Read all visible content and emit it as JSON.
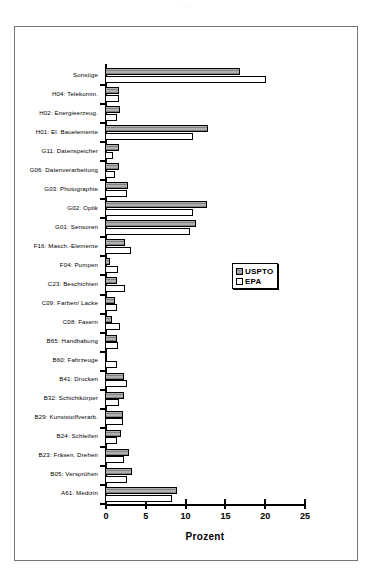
{
  "page": {
    "artifact_text": "..."
  },
  "chart_data": {
    "type": "bar",
    "orientation": "horizontal",
    "title": "",
    "xlabel": "Prozent",
    "ylabel": "",
    "xlim": [
      0,
      25
    ],
    "xticks": [
      0,
      5,
      10,
      15,
      20,
      25
    ],
    "grid": false,
    "legend_position": "center-right",
    "categories": [
      "Sonstige",
      "H04: Telekomm.",
      "H02:  Energieerzeug.",
      "H01: El. Bauelemente",
      "G11: Datenspeicher",
      "G06: Datenverarbeitung",
      "G03: Photographie",
      "G02: Optik",
      "G01: Sensoren",
      "F16: Masch.-Elemente",
      "F04: Pumpen",
      "C23: Beschichten",
      "C09: Farben/ Lacke",
      "C08: Fasern",
      "B65: Handhabung",
      "B60: Fahrzeuge",
      "B41: Drucken",
      "B32: Schichtkörper",
      "B29: Kunststoffverarb.",
      "B24: Schleifen",
      "B23: Fräsen, Drehen",
      "B05: Versprühen",
      "A61: Medizin"
    ],
    "series": [
      {
        "name": "USPTO",
        "color": "#b0b0b0",
        "pattern": "horizontal-hatch",
        "values": [
          17.0,
          1.7,
          1.9,
          13.0,
          1.8,
          1.8,
          2.9,
          12.8,
          11.4,
          2.5,
          0.6,
          1.5,
          1.3,
          0.9,
          1.5,
          0.2,
          2.4,
          2.4,
          2.2,
          2.0,
          3.0,
          3.4,
          9.1
        ]
      },
      {
        "name": "EPA",
        "color": "#ffffff",
        "pattern": "solid-white",
        "values": [
          20.2,
          1.8,
          1.5,
          11.1,
          1.0,
          1.3,
          2.8,
          11.0,
          10.7,
          3.3,
          1.6,
          2.5,
          1.5,
          1.9,
          1.6,
          1.5,
          2.8,
          1.8,
          2.3,
          1.5,
          2.4,
          2.8,
          8.4
        ]
      }
    ]
  },
  "legend": {
    "items": [
      {
        "label": "USPTO"
      },
      {
        "label": "EPA"
      }
    ]
  }
}
